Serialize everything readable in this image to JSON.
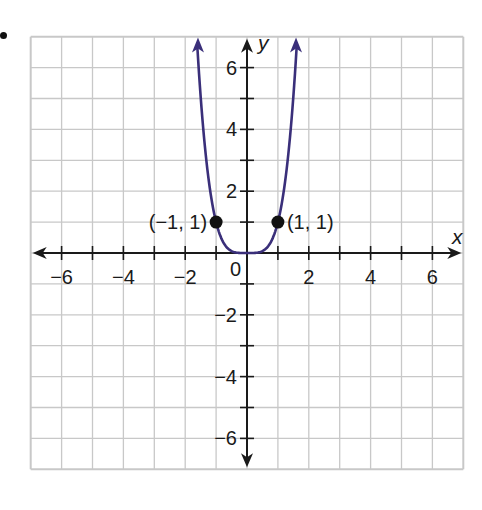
{
  "chart_data": {
    "type": "line",
    "title": "",
    "function": "y = x^4",
    "xlabel": "x",
    "ylabel": "y",
    "xlim": [
      -7,
      7
    ],
    "ylim": [
      -7,
      7
    ],
    "grid": true,
    "x_ticks": [
      -6,
      -4,
      -2,
      0,
      2,
      4,
      6
    ],
    "y_ticks": [
      -6,
      -4,
      -2,
      2,
      4,
      6
    ],
    "x_tick_labels": [
      "−6",
      "−4",
      "−2",
      "0",
      "2",
      "4",
      "6"
    ],
    "y_tick_labels": [
      "−6",
      "−4",
      "−2",
      "2",
      "4",
      "6"
    ],
    "origin_label": "0",
    "series": [
      {
        "name": "y = x^4",
        "color": "#3a2f7a",
        "x": [
          -1.63,
          -1.5,
          -1.25,
          -1,
          -0.75,
          -0.5,
          -0.25,
          0,
          0.25,
          0.5,
          0.75,
          1,
          1.25,
          1.5,
          1.63
        ],
        "y": [
          7.06,
          5.06,
          2.44,
          1,
          0.32,
          0.06,
          0.004,
          0,
          0.004,
          0.06,
          0.32,
          1,
          2.44,
          5.06,
          7.06
        ]
      }
    ],
    "points": [
      {
        "x": -1,
        "y": 1,
        "label": "(−1, 1)"
      },
      {
        "x": 1,
        "y": 1,
        "label": "(1, 1)"
      }
    ],
    "colors": {
      "grid": "#c8c8c8",
      "axis": "#1a1a1a",
      "curve": "#3a2f7a",
      "point": "#111111"
    }
  }
}
